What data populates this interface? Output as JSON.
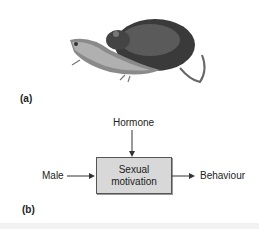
{
  "panel_a": {
    "label": "(a)",
    "illustration": "rats-mating-illustration"
  },
  "panel_b": {
    "label": "(b)",
    "nodes": {
      "hormone": "Hormone",
      "male": "Male",
      "box_line1": "Sexual",
      "box_line2": "motivation",
      "behaviour": "Behaviour"
    }
  }
}
